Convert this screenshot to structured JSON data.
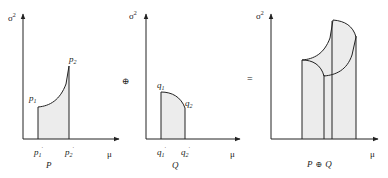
{
  "diagram": {
    "operator_plus": "⊕",
    "operator_equals": "=",
    "panels": [
      {
        "name": "P",
        "y_label": "σ",
        "y_label_sup": "2",
        "x_label": "μ",
        "title": "P",
        "points": [
          {
            "label": "p",
            "sub": "1"
          },
          {
            "label": "p",
            "sub": "2"
          }
        ],
        "ticks": [
          {
            "label": "p",
            "sub": "1",
            "prime": "'"
          },
          {
            "label": "p",
            "sub": "2",
            "prime": "'"
          }
        ]
      },
      {
        "name": "Q",
        "y_label": "σ",
        "y_label_sup": "2",
        "x_label": "μ",
        "title": "Q",
        "points": [
          {
            "label": "q",
            "sub": "1"
          },
          {
            "label": "q",
            "sub": "2"
          }
        ],
        "ticks": [
          {
            "label": "q",
            "sub": "1",
            "prime": "'"
          },
          {
            "label": "q",
            "sub": "2",
            "prime": "'"
          }
        ]
      },
      {
        "name": "P ⊕ Q",
        "y_label": "σ",
        "y_label_sup": "2",
        "x_label": "μ",
        "title_left": "P",
        "title_op": "⊕",
        "title_right": "Q"
      }
    ],
    "colors": {
      "line": "#222222",
      "fill": "#ececec"
    }
  }
}
